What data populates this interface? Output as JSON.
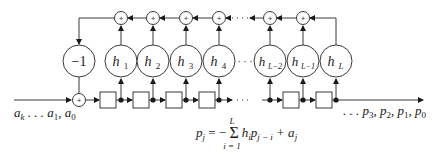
{
  "diagram": {
    "input_label": "a_k . . . a_1, a_0",
    "output_label": ". . . p_3, p_2, p_1, p_0",
    "equation": "p_j = − Σ_{i=1}^{L} h_i p_{j−i} + a_j",
    "equation_parts": {
      "lhs": "p",
      "lhs_sub": "j",
      "eq": " = − ",
      "sum": "Σ",
      "sum_upper": "L",
      "sum_lower": "i = 1",
      "h": "h",
      "h_sub": "i",
      "p": "p",
      "p_sub": "j − i",
      "plus": " + a",
      "a_sub": "j"
    },
    "multipliers": [
      {
        "label": "−1",
        "sub": ""
      },
      {
        "label": "h",
        "sub": "1"
      },
      {
        "label": "h",
        "sub": "2"
      },
      {
        "label": "h",
        "sub": "3"
      },
      {
        "label": "h",
        "sub": "4"
      },
      {
        "label": "h",
        "sub": "L−2"
      },
      {
        "label": "h",
        "sub": "L−1"
      },
      {
        "label": "h",
        "sub": "L"
      }
    ],
    "adder_symbol": "+",
    "ellipsis": "· · ·",
    "input_seq": {
      "a": "a",
      "k": "k",
      "mid": " . . . a",
      "one": "1",
      "comma": ", a",
      "zero": "0"
    },
    "output_seq": {
      "lead": ". . . p",
      "s3": "3",
      "c1": ", p",
      "s2": "2",
      "c2": ", p",
      "s1": "1",
      "c3": ", p",
      "s0": "0"
    }
  }
}
